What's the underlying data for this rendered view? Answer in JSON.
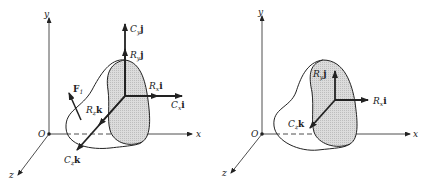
{
  "figure": {
    "left": {
      "axes": {
        "x": "x",
        "y": "y",
        "z": "z",
        "origin": "O"
      },
      "force_label": {
        "main": "F",
        "sub": "1"
      },
      "vectors": [
        {
          "id": "Cy",
          "main": "C",
          "sub": "y",
          "unit": "j"
        },
        {
          "id": "Ry",
          "main": "R",
          "sub": "y",
          "unit": "j"
        },
        {
          "id": "Rx",
          "main": "R",
          "sub": "x",
          "unit": "i"
        },
        {
          "id": "Cx",
          "main": "C",
          "sub": "x",
          "unit": "i"
        },
        {
          "id": "Rz",
          "main": "R",
          "sub": "z",
          "unit": "k"
        },
        {
          "id": "Cz",
          "main": "C",
          "sub": "z",
          "unit": "k"
        }
      ]
    },
    "right": {
      "axes": {
        "x": "x",
        "y": "y",
        "z": "z",
        "origin": "O"
      },
      "vectors": [
        {
          "id": "Ry",
          "main": "R",
          "sub": "y",
          "unit": "j"
        },
        {
          "id": "Rx",
          "main": "R",
          "sub": "x",
          "unit": "i"
        },
        {
          "id": "Cz",
          "main": "C",
          "sub": "z",
          "unit": "k"
        }
      ]
    },
    "colors": {
      "line": "#222222",
      "shade": "#d6d6d6",
      "background": "#ffffff"
    }
  }
}
